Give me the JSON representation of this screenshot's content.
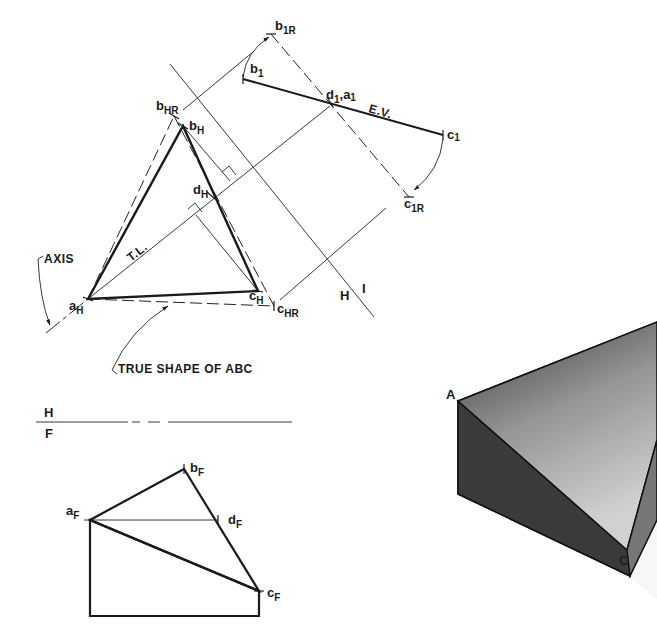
{
  "figure": {
    "type": "descriptive geometry construction"
  },
  "horizontal_view": {
    "points": {
      "a": {
        "base": "a",
        "sub": "H"
      },
      "b": {
        "base": "b",
        "sub": "H"
      },
      "c": {
        "base": "c",
        "sub": "H"
      },
      "d": {
        "base": "d",
        "sub": "H"
      },
      "b_rev": {
        "base": "b",
        "sub": "HR"
      },
      "c_rev": {
        "base": "c",
        "sub": "HR"
      }
    },
    "annotations": {
      "true_length": "T.L.",
      "axis": "AXIS",
      "true_shape": "TRUE SHAPE OF ABC"
    }
  },
  "auxiliary_view": {
    "points": {
      "b": {
        "base": "b",
        "sub": "1"
      },
      "c": {
        "base": "c",
        "sub": "1"
      },
      "da": {
        "base": "d",
        "sub": "1",
        "extra": ",a",
        "extra_sub": "1"
      },
      "b_rev": {
        "base": "b",
        "sub": "1R"
      },
      "c_rev": {
        "base": "c",
        "sub": "1R"
      }
    },
    "annotations": {
      "edge_view": "E.V."
    }
  },
  "folding_lines": {
    "h1": {
      "left": "H",
      "right": "I"
    },
    "hf": {
      "top": "H",
      "bottom": "F"
    }
  },
  "front_view": {
    "points": {
      "a": {
        "base": "a",
        "sub": "F"
      },
      "b": {
        "base": "b",
        "sub": "F"
      },
      "c": {
        "base": "c",
        "sub": "F"
      },
      "d": {
        "base": "d",
        "sub": "F"
      }
    }
  },
  "pictorial": {
    "labels": {
      "a": "A",
      "c": "C"
    }
  }
}
